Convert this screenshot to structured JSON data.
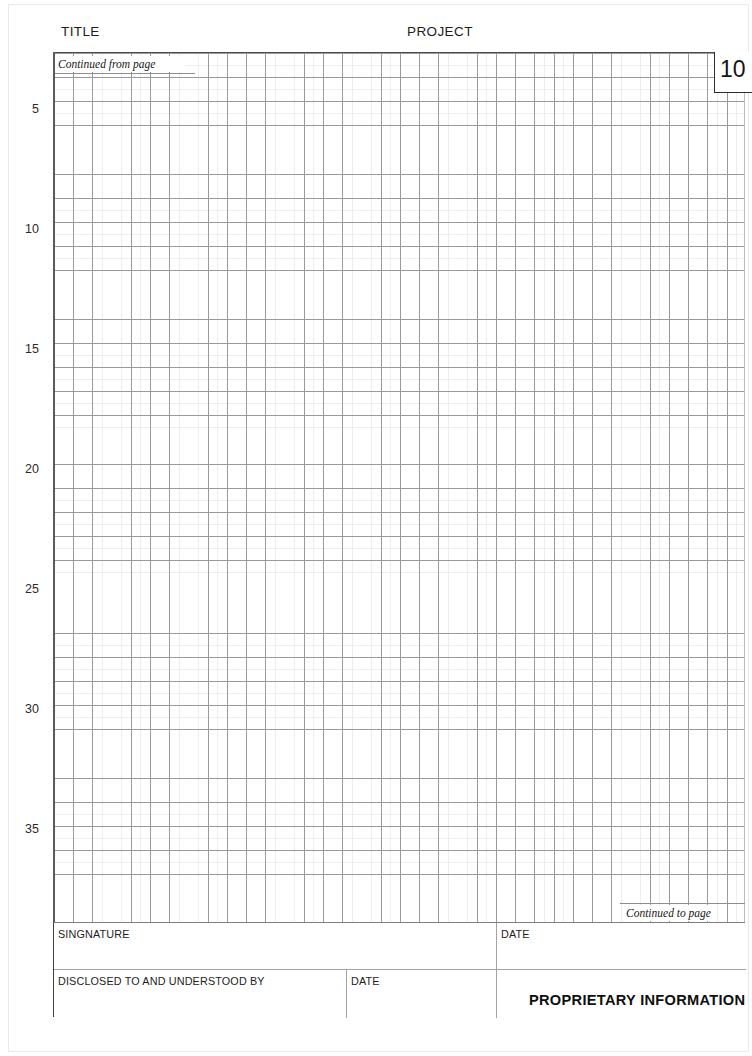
{
  "document": {
    "type": "lab-notebook-page",
    "page_number": "10"
  },
  "header": {
    "title_label": "TITLE",
    "project_label": "PROJECT"
  },
  "grid": {
    "continued_from_label": "Continued from page",
    "continued_to_label": "Continued to page",
    "row_numbers": [
      "5",
      "10",
      "15",
      "20",
      "25",
      "30",
      "35"
    ],
    "row_number_positions": [
      103,
      223,
      343,
      463,
      583,
      703,
      823
    ],
    "columns": 36,
    "rows": 36
  },
  "footer": {
    "signature_label": "SINGNATURE",
    "signature_date_label": "DATE",
    "disclosed_label": "DISCLOSED TO AND UNDERSTOOD BY",
    "disclosed_date_label": "DATE",
    "proprietary_label": "PROPRIETARY INFORMATION"
  },
  "colors": {
    "grid_major": "#9a9a9a",
    "grid_minor": "#ededed",
    "border_dark": "#2d2d2d",
    "text": "#1c1c1c",
    "page_background": "#ffffff"
  }
}
